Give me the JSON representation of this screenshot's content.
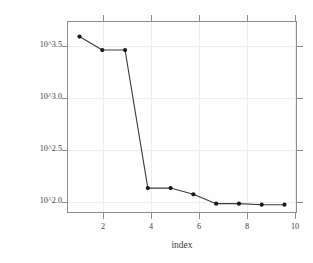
{
  "chart_data": {
    "type": "line",
    "title": "",
    "subtitle": "",
    "xlabel": "index",
    "ylabel": "eigenvalue norms",
    "x": [
      1,
      2,
      3,
      4,
      5,
      6,
      7,
      8,
      9,
      10
    ],
    "values": [
      3.62,
      3.49,
      3.49,
      2.16,
      2.16,
      2.1,
      2.01,
      2.01,
      2.0,
      2.0
    ],
    "y_value_note": "values are log10 exponents as shown by 10^x axis labels",
    "series": [
      {
        "name": "eigenvalue norms",
        "values": [
          3.62,
          3.49,
          3.49,
          2.16,
          2.16,
          2.1,
          2.01,
          2.01,
          2.0,
          2.0
        ]
      }
    ],
    "xticks": [
      2,
      4,
      6,
      8,
      10
    ],
    "xtick_labels": [
      "2",
      "4",
      "6",
      "8",
      "10"
    ],
    "yticks": [
      2.0,
      2.5,
      3.0,
      3.5
    ],
    "ytick_labels": [
      "10^2.0",
      "10^2.5",
      "10^3.0",
      "10^3.5"
    ],
    "xlim": [
      0.45,
      10.55
    ],
    "ylim": [
      1.92,
      3.77
    ],
    "grid": true,
    "grid_color": "#ededed",
    "legend": false,
    "legend_position": "none",
    "marker": "filled-circle",
    "marker_color": "#1a1a1a",
    "line_color": "#3c3c3c",
    "axis_color": "#8e8e8e",
    "background_color": "#fefefe",
    "annotations": []
  }
}
